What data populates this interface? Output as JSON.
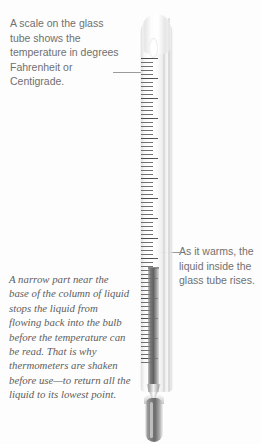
{
  "page": {
    "background_color": "#fdfdfd"
  },
  "colors": {
    "sans_text": "#707070",
    "italic_text": "#5d5d5d",
    "leader_line": "#9a9a9a",
    "liquid": "#6c6c6c",
    "glass": "#f2f2f2",
    "scale_tick": "#5a5a5a"
  },
  "callouts": {
    "top_left": {
      "text": "A scale on the glass tube shows the temperature in degrees Fahrenheit or Centigrade.",
      "style": "sans-serif",
      "points_to": "scale-ticks"
    },
    "right": {
      "text": "As it warms, the liquid inside the glass tube rises.",
      "style": "sans-serif",
      "points_to": "liquid-column-top"
    },
    "bottom_left": {
      "text": "A narrow part near the base of the column of liquid stops the liquid from flowing back into the bulb before the temperature can be read. That is why thermometers are shaken before use—to return all the liquid to its lowest point.",
      "style": "italic-serif",
      "points_to": "constriction"
    }
  },
  "thermometer": {
    "label": "clinical thermometer",
    "parts": {
      "dome_cap": "rounded glass top",
      "neck_void": "air space in neck",
      "scale": "engraved temperature scale",
      "liquid_column": "mercury column",
      "constriction": "narrow part above bulb",
      "bulb": "liquid reservoir bulb"
    }
  }
}
